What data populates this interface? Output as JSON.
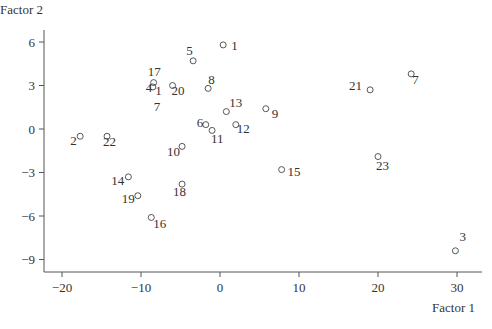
{
  "chart_data": {
    "type": "scatter",
    "title": "",
    "xlabel": "Factor 1",
    "ylabel": "Factor 2",
    "xlim": [
      -22.5,
      33
    ],
    "ylim": [
      -9.8,
      6.8
    ],
    "xticks": [
      -20,
      -10,
      0,
      10,
      20,
      30
    ],
    "yticks": [
      6,
      3,
      0,
      -3,
      -6,
      -9
    ],
    "grid": false,
    "legend": null,
    "marker": "open-circle",
    "points": [
      {
        "label": "1",
        "x": 0.4,
        "y": 5.8,
        "lx": 8,
        "ly": 5
      },
      {
        "label": "2",
        "x": -17.7,
        "y": -0.5,
        "lx": -10,
        "ly": 9
      },
      {
        "label": "3",
        "x": 29.8,
        "y": -8.4,
        "lx": 4,
        "ly": -10
      },
      {
        "label": "4",
        "x": -8.5,
        "y": 2.9,
        "lx": -7,
        "ly": 5
      },
      {
        "label": "5",
        "x": -3.4,
        "y": 4.7,
        "lx": -7,
        "ly": -6
      },
      {
        "label": "6",
        "x": -1.8,
        "y": 0.3,
        "lx": -9,
        "ly": 2
      },
      {
        "label": "7",
        "x": 24.2,
        "y": 3.8,
        "lx": 1,
        "ly": 10
      },
      {
        "label": "8",
        "x": -1.5,
        "y": 2.8,
        "lx": 0,
        "ly": -4
      },
      {
        "label": "9",
        "x": 5.8,
        "y": 1.4,
        "lx": 6,
        "ly": 9
      },
      {
        "label": "10",
        "x": -4.8,
        "y": -1.2,
        "lx": -15,
        "ly": 10
      },
      {
        "label": "11",
        "x": -1.0,
        "y": -0.1,
        "lx": -1,
        "ly": 13
      },
      {
        "label": "12",
        "x": 2.0,
        "y": 0.3,
        "lx": 1,
        "ly": 8
      },
      {
        "label": "13",
        "x": 0.8,
        "y": 1.2,
        "lx": 3,
        "ly": -5
      },
      {
        "label": "14",
        "x": -11.6,
        "y": -3.3,
        "lx": -17,
        "ly": 8
      },
      {
        "label": "15",
        "x": 7.8,
        "y": -2.8,
        "lx": 6,
        "ly": 6
      },
      {
        "label": "16",
        "x": -8.7,
        "y": -6.1,
        "lx": 2,
        "ly": 11
      },
      {
        "label": "17",
        "x": -8.4,
        "y": 3.2,
        "lx": -6,
        "ly": -7
      },
      {
        "label": "18",
        "x": -4.8,
        "y": -3.8,
        "lx": -9,
        "ly": 12
      },
      {
        "label": "19",
        "x": -10.4,
        "y": -4.6,
        "lx": -16,
        "ly": 7
      },
      {
        "label": "20",
        "x": -6.0,
        "y": 3.0,
        "lx": -1,
        "ly": 9
      },
      {
        "label": "21",
        "x": 19.0,
        "y": 2.7,
        "lx": -21,
        "ly": 0
      },
      {
        "label": "22",
        "x": -14.3,
        "y": -0.5,
        "lx": -4,
        "ly": 10
      },
      {
        "label": "23",
        "x": 20.0,
        "y": -1.9,
        "lx": -2,
        "ly": 13
      }
    ],
    "extra_labels": [
      {
        "text": "1",
        "x": -8.2,
        "y": 2.7
      },
      {
        "text": "7",
        "x": -8.4,
        "y": 1.6
      }
    ]
  }
}
